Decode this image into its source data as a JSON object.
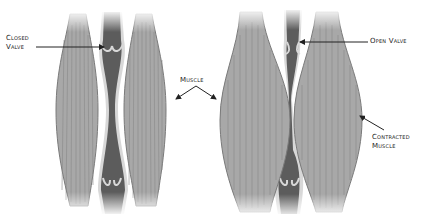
{
  "diagram": {
    "type": "anatomy-illustration",
    "panels": [
      {
        "id": "relaxed",
        "state": "muscles relaxed",
        "valve_state": "closed"
      },
      {
        "id": "contracted",
        "state": "muscles contracted",
        "valve_state": "open"
      }
    ],
    "colors": {
      "muscle_fill": "#a8a8a8",
      "muscle_stroke": "#7a7a7a",
      "muscle_fiber": "#888888",
      "vein_fill": "#5c5c5c",
      "vein_wall": "#d8d8d8",
      "text": "#222222",
      "arrow": "#222222",
      "background": "#ffffff"
    }
  },
  "labels": {
    "closed_valve_line1": "Closed",
    "closed_valve_line2": "Valve",
    "muscle": "Muscle",
    "open_valve": "Open Valve",
    "contracted_line1": "Contracted",
    "contracted_line2": "Muscle"
  }
}
